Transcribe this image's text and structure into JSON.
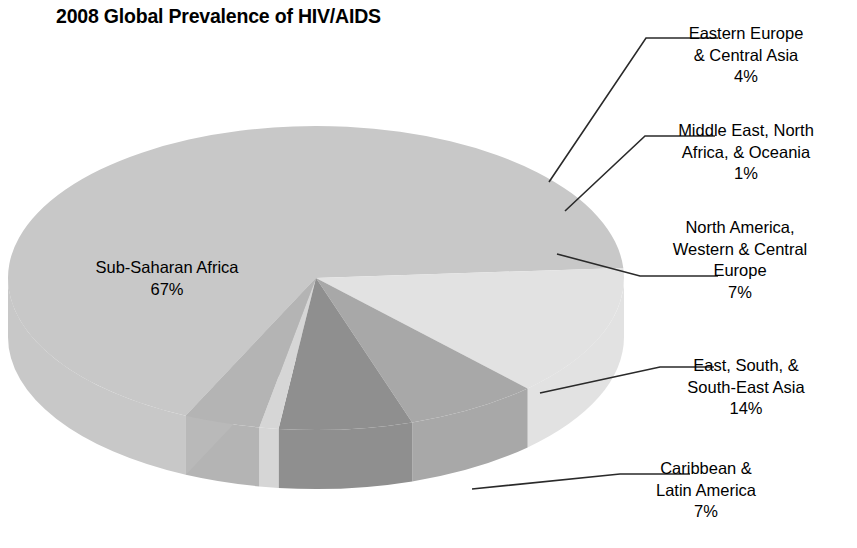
{
  "chart_data": {
    "type": "pie",
    "title": "2008 Global Prevalence of HIV/AIDS",
    "xlabel": "",
    "ylabel": "",
    "legend_position": "none",
    "grid": false,
    "three_d": true,
    "categories": [
      "Sub-Saharan Africa",
      "East, South, & South-East Asia",
      "Caribbean & Latin America",
      "North America, Western & Central Europe",
      "Middle East, North Africa, & Oceania",
      "Eastern Europe & Central Asia"
    ],
    "values": [
      67,
      14,
      7,
      7,
      1,
      4
    ],
    "value_labels": [
      "67%",
      "14%",
      "7%",
      "7%",
      "1%",
      "4%"
    ],
    "colors": [
      "#c8c8c8",
      "#e2e2e2",
      "#a8a8a8",
      "#8f8f8f",
      "#d6d6d6",
      "#b4b4b4"
    ]
  },
  "title": {
    "text": "2008 Global Prevalence of HIV/AIDS"
  },
  "inner_labels": [
    {
      "id": "ssa",
      "name": "Sub-Saharan Africa",
      "percent": "67%"
    }
  ],
  "callouts": [
    {
      "id": "eeca",
      "name": "Eastern Europe\n& Central Asia",
      "percent": "4%"
    },
    {
      "id": "mena",
      "name": "Middle East, North\nAfrica, & Oceania",
      "percent": "1%"
    },
    {
      "id": "naeu",
      "name": "North America,\nWestern & Central\nEurope",
      "percent": "7%"
    },
    {
      "id": "asia",
      "name": "East, South, &\nSouth-East Asia",
      "percent": "14%"
    },
    {
      "id": "carib",
      "name": "Caribbean &\nLatin America",
      "percent": "7%"
    }
  ]
}
